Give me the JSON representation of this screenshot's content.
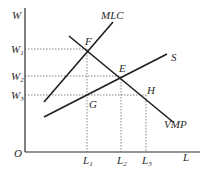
{
  "diagram": {
    "type": "labor-market-monopsony",
    "axes": {
      "y_label": "W",
      "x_label": "L",
      "origin_label": "O"
    },
    "y_ticks": [
      {
        "base": "W",
        "sub": "1"
      },
      {
        "base": "W",
        "sub": "2"
      },
      {
        "base": "W",
        "sub": "3"
      }
    ],
    "x_ticks": [
      {
        "base": "L",
        "sub": "1"
      },
      {
        "base": "L",
        "sub": "2"
      },
      {
        "base": "L",
        "sub": "3"
      }
    ],
    "curves": {
      "mlc": "MLC",
      "s": "S",
      "vmp": "VMP"
    },
    "points": {
      "f": "F",
      "e": "E",
      "g": "G",
      "h": "H"
    },
    "colors": {
      "line": "#1e1e1e",
      "guide": "#666666",
      "background": "#ffffff"
    }
  }
}
